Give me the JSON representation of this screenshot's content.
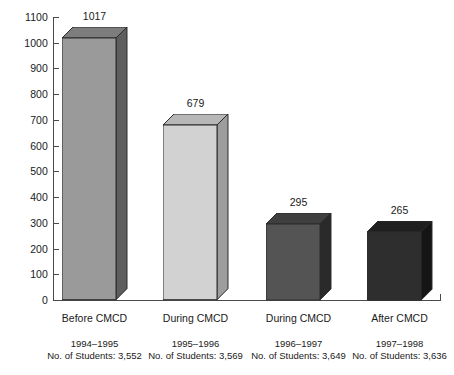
{
  "chart_data": {
    "type": "bar",
    "title": "",
    "subtitle": "",
    "xlabel": "",
    "ylabel": "",
    "ylim": [
      0,
      1100
    ],
    "ytick_step": 100,
    "yticks": [
      0,
      100,
      200,
      300,
      400,
      500,
      600,
      700,
      800,
      900,
      1000,
      1100
    ],
    "ytick_labels": [
      "0",
      "100",
      "200",
      "300",
      "400",
      "500",
      "600",
      "700",
      "800",
      "900",
      "1000",
      "1100"
    ],
    "grid": false,
    "legend": "none",
    "three_d": true,
    "categories": [
      "Before CMCD",
      "During CMCD",
      "During CMCD",
      "After CMCD"
    ],
    "values": [
      1017,
      679,
      295,
      265
    ],
    "value_labels": [
      "1017",
      "679",
      "295",
      "265"
    ],
    "bar_colors": [
      "#9a9a9a",
      "#d2d2d2",
      "#545454",
      "#2e2e2e"
    ],
    "bar_top_colors": [
      "#7d7d7d",
      "#b7b7b7",
      "#3f3f3f",
      "#1f1f1f"
    ],
    "bar_side_colors": [
      "#5e5e5e",
      "#9d9d9d",
      "#2a2a2a",
      "#151515"
    ],
    "annotations": [
      {
        "period": "1994–1995",
        "students": "No. of Students: 3,552"
      },
      {
        "period": "1995–1996",
        "students": "No. of Students: 3,569"
      },
      {
        "period": "1996–1997",
        "students": "No. of Students: 3,649"
      },
      {
        "period": "1997–1998",
        "students": "No. of Students: 3,636"
      }
    ],
    "axis_color": "#4a4a4a",
    "text_color": "#1a1a1a",
    "background_color": "#ffffff"
  }
}
